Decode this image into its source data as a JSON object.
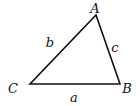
{
  "diagram": {
    "type": "triangle",
    "colors": {
      "stroke": "#111111",
      "background": "#ffffff"
    },
    "vertices": [
      {
        "name": "A",
        "x": 96,
        "y": 15,
        "label_x": 95,
        "label_y": 13
      },
      {
        "name": "B",
        "x": 120,
        "y": 84,
        "label_x": 127,
        "label_y": 93
      },
      {
        "name": "C",
        "x": 30,
        "y": 84,
        "label_x": 13,
        "label_y": 93
      }
    ],
    "sides": [
      {
        "name": "a",
        "between": "B-C",
        "label_x": 74,
        "label_y": 102
      },
      {
        "name": "b",
        "between": "A-C",
        "label_x": 50,
        "label_y": 47
      },
      {
        "name": "c",
        "between": "A-B",
        "label_x": 115,
        "label_y": 52
      }
    ]
  }
}
